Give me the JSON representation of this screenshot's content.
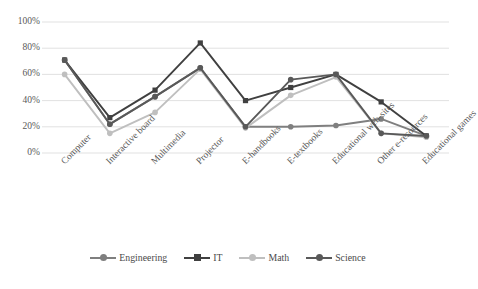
{
  "chart_data": {
    "type": "line",
    "title": "",
    "subtitle": "",
    "xlabel": "",
    "ylabel": "",
    "ylim": [
      0,
      100
    ],
    "ytick_labels": [
      "0%",
      "20%",
      "40%",
      "60%",
      "80%",
      "100%"
    ],
    "ytick_values": [
      0,
      20,
      40,
      60,
      80,
      100
    ],
    "grid": true,
    "legend_position": "bottom",
    "categories": [
      "Computer",
      "Interactive board",
      "Multimedia",
      "Projector",
      "E-handbooks",
      "E-textbooks",
      "Educational web-sites",
      "Other e-resources",
      "Educational games"
    ],
    "series": [
      {
        "name": "Engineering",
        "color": "#7f7f7f",
        "marker": "circle",
        "values": [
          71,
          22,
          43,
          65,
          20,
          20,
          21,
          26,
          13
        ]
      },
      {
        "name": "IT",
        "color": "#404040",
        "marker": "square",
        "values": [
          71,
          27,
          48,
          84,
          40,
          50,
          60,
          39,
          13
        ]
      },
      {
        "name": "Math",
        "color": "#bfbfbf",
        "marker": "circle",
        "values": [
          60,
          15,
          31,
          64,
          19,
          44,
          58,
          15,
          12
        ]
      },
      {
        "name": "Science",
        "color": "#595959",
        "marker": "circle",
        "values": [
          71,
          22,
          43,
          65,
          20,
          56,
          60,
          15,
          13
        ]
      }
    ]
  },
  "legend": {
    "items": [
      {
        "label": "Engineering"
      },
      {
        "label": "IT"
      },
      {
        "label": "Math"
      },
      {
        "label": "Science"
      }
    ]
  },
  "axes": {
    "y": {
      "labels": [
        "100%",
        "80%",
        "60%",
        "40%",
        "20%",
        "0%"
      ]
    },
    "x": {
      "labels": [
        "Computer",
        "Interactive board",
        "Multimedia",
        "Projector",
        "E-handbooks",
        "E-textbooks",
        "Educational web-sites",
        "Other e-resources",
        "Educational games"
      ]
    }
  }
}
